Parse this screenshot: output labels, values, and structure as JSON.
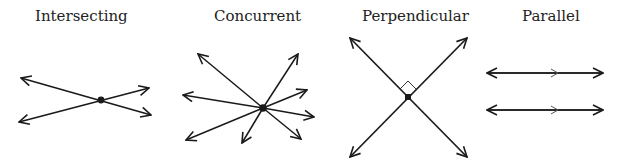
{
  "diagrams": [
    {
      "id": "intersecting",
      "label": "Intersecting"
    },
    {
      "id": "concurrent",
      "label": "Concurrent"
    },
    {
      "id": "perpendicular",
      "label": "Perpendicular"
    },
    {
      "id": "parallel",
      "label": "Parallel"
    }
  ],
  "colors": {
    "stroke": "#1a1a1a",
    "background": "#ffffff"
  }
}
